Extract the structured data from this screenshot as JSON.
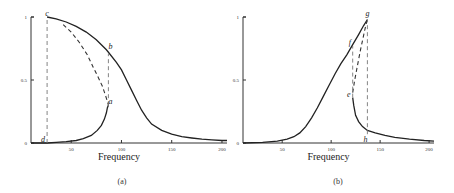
{
  "chart_data": [
    {
      "type": "line",
      "caption": "(a)",
      "xlabel": "Frequency",
      "ylabel": "",
      "xlim": [
        10,
        205
      ],
      "ylim": [
        0,
        1
      ],
      "xticks": [
        50,
        100,
        150,
        200
      ],
      "yticks": [
        0,
        0.5,
        1
      ],
      "ytick_labels": [
        "0",
        "0.5",
        "1"
      ],
      "series": [
        {
          "name": "upper-branch",
          "style": "solid",
          "x": [
            26,
            35,
            45,
            55,
            65,
            75,
            85,
            88,
            95,
            100,
            105,
            110,
            115,
            120,
            125,
            130,
            140,
            150,
            160,
            170,
            180,
            190,
            200,
            205
          ],
          "y": [
            1.0,
            0.985,
            0.96,
            0.925,
            0.88,
            0.82,
            0.74,
            0.71,
            0.64,
            0.58,
            0.5,
            0.42,
            0.34,
            0.26,
            0.2,
            0.15,
            0.1,
            0.07,
            0.05,
            0.04,
            0.03,
            0.025,
            0.02,
            0.02
          ]
        },
        {
          "name": "unstable-branch",
          "style": "dashed",
          "x": [
            42,
            50,
            58,
            66,
            72,
            77,
            81,
            84,
            86,
            87
          ],
          "y": [
            0.94,
            0.88,
            0.8,
            0.7,
            0.6,
            0.52,
            0.45,
            0.38,
            0.33,
            0.3
          ]
        },
        {
          "name": "lower-branch",
          "style": "solid",
          "x": [
            10,
            20,
            26,
            35,
            45,
            55,
            62,
            70,
            76,
            80,
            83,
            85,
            86,
            87
          ],
          "y": [
            0.0,
            0.0,
            0.0,
            0.005,
            0.01,
            0.02,
            0.035,
            0.06,
            0.1,
            0.14,
            0.19,
            0.24,
            0.28,
            0.3
          ]
        },
        {
          "name": "jump-down-c-d",
          "style": "dashed-vertical",
          "x": [
            26,
            26
          ],
          "y": [
            0.0,
            1.0
          ]
        },
        {
          "name": "jump-up-a-b",
          "style": "dashed-vertical",
          "x": [
            87,
            87
          ],
          "y": [
            0.3,
            0.71
          ]
        }
      ],
      "annotations": [
        {
          "text": "c",
          "x": 26,
          "y": 1.0
        },
        {
          "text": "b",
          "x": 89,
          "y": 0.74
        },
        {
          "text": "a",
          "x": 89,
          "y": 0.3
        },
        {
          "text": "d",
          "x": 22,
          "y": 0.0
        }
      ]
    },
    {
      "type": "line",
      "caption": "(b)",
      "xlabel": "Frequency",
      "ylabel": "",
      "xlim": [
        10,
        205
      ],
      "ylim": [
        0,
        1
      ],
      "xticks": [
        50,
        100,
        150,
        200
      ],
      "yticks": [
        0,
        0.5,
        1
      ],
      "ytick_labels": [
        "0",
        "0.5",
        "1"
      ],
      "series": [
        {
          "name": "upper-branch",
          "style": "solid",
          "x": [
            10,
            30,
            45,
            55,
            62,
            68,
            74,
            80,
            86,
            92,
            98,
            104,
            110,
            116,
            122,
            128,
            133,
            137
          ],
          "y": [
            0.0,
            0.005,
            0.015,
            0.03,
            0.05,
            0.08,
            0.13,
            0.2,
            0.28,
            0.37,
            0.46,
            0.55,
            0.63,
            0.7,
            0.78,
            0.86,
            0.93,
            0.98
          ]
        },
        {
          "name": "unstable-branch",
          "style": "dashed",
          "x": [
            122,
            124,
            127,
            130,
            133,
            135,
            137
          ],
          "y": [
            0.4,
            0.5,
            0.62,
            0.74,
            0.85,
            0.92,
            0.98
          ]
        },
        {
          "name": "lower-branch",
          "style": "solid",
          "x": [
            122,
            123,
            125,
            128,
            132,
            137,
            145,
            155,
            165,
            180,
            195,
            205
          ],
          "y": [
            0.36,
            0.3,
            0.22,
            0.17,
            0.13,
            0.1,
            0.08,
            0.06,
            0.045,
            0.03,
            0.02,
            0.015
          ]
        },
        {
          "name": "jump-down-g-h",
          "style": "dashed-vertical",
          "x": [
            137,
            137
          ],
          "y": [
            0.07,
            0.98
          ]
        },
        {
          "name": "jump-up-e-f",
          "style": "dashed-vertical",
          "x": [
            122,
            122
          ],
          "y": [
            0.36,
            0.77
          ]
        }
      ],
      "annotations": [
        {
          "text": "g",
          "x": 137,
          "y": 1.0
        },
        {
          "text": "f",
          "x": 119,
          "y": 0.77
        },
        {
          "text": "e",
          "x": 118,
          "y": 0.36
        },
        {
          "text": "h",
          "x": 135,
          "y": 0.0
        }
      ]
    }
  ]
}
